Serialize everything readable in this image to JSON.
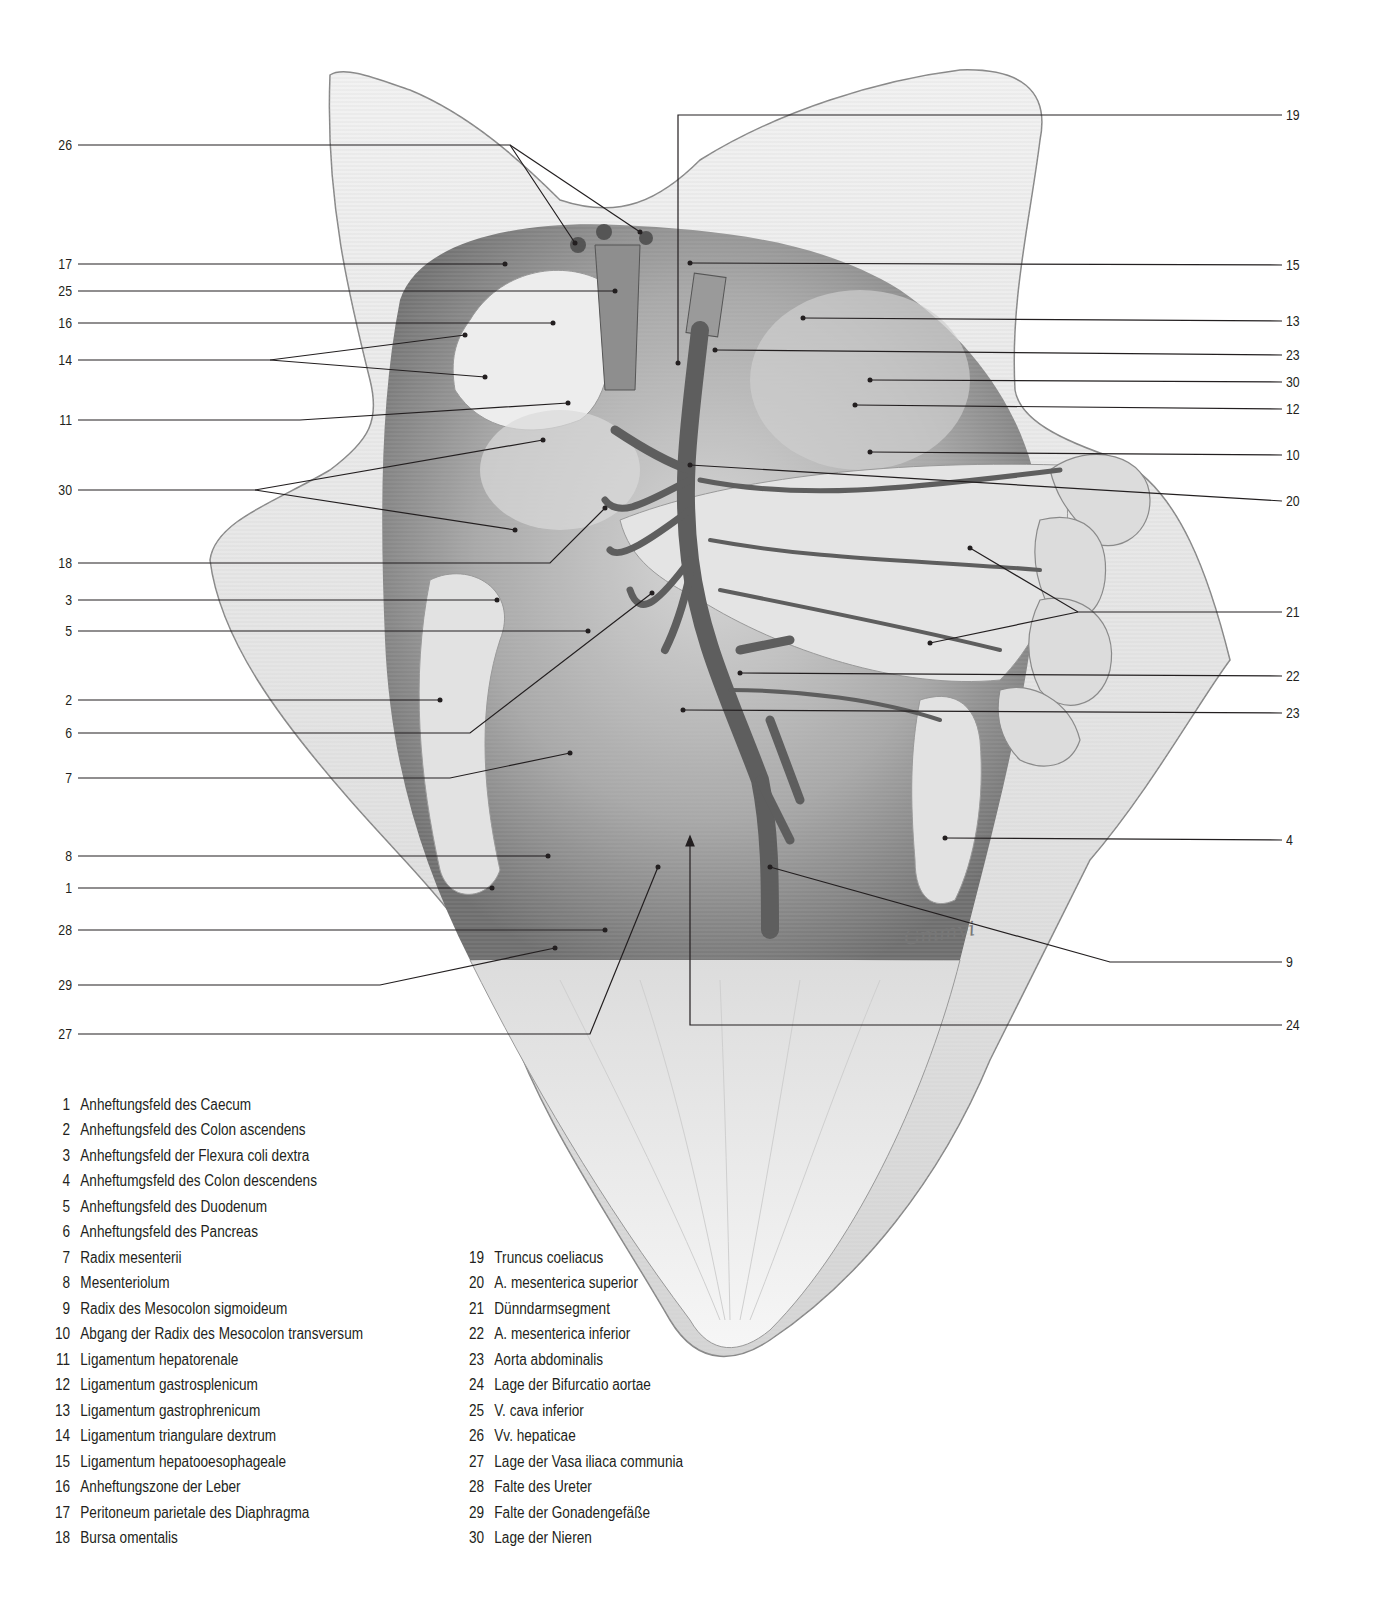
{
  "figure": {
    "colors": {
      "ink": "#231f20",
      "tissue_light": "#e9e9e9",
      "tissue_mid": "#b5b5b5",
      "tissue_dark": "#6b6b6b",
      "vessel": "#5a5a5a",
      "background": "#ffffff"
    },
    "signature": "Gmmvi",
    "left_labels": [
      {
        "num": "26",
        "y": 145
      },
      {
        "num": "17",
        "y": 264
      },
      {
        "num": "25",
        "y": 291
      },
      {
        "num": "16",
        "y": 323
      },
      {
        "num": "14",
        "y": 360
      },
      {
        "num": "11",
        "y": 420
      },
      {
        "num": "30",
        "y": 490
      },
      {
        "num": "18",
        "y": 563
      },
      {
        "num": "3",
        "y": 600
      },
      {
        "num": "5",
        "y": 631
      },
      {
        "num": "2",
        "y": 700
      },
      {
        "num": "6",
        "y": 733
      },
      {
        "num": "7",
        "y": 778
      },
      {
        "num": "8",
        "y": 856
      },
      {
        "num": "1",
        "y": 888
      },
      {
        "num": "28",
        "y": 930
      },
      {
        "num": "29",
        "y": 985
      },
      {
        "num": "27",
        "y": 1034
      }
    ],
    "right_labels": [
      {
        "num": "19",
        "y": 115
      },
      {
        "num": "15",
        "y": 265
      },
      {
        "num": "13",
        "y": 321
      },
      {
        "num": "23",
        "y": 355
      },
      {
        "num": "30",
        "y": 382
      },
      {
        "num": "12",
        "y": 409
      },
      {
        "num": "10",
        "y": 455
      },
      {
        "num": "20",
        "y": 501
      },
      {
        "num": "21",
        "y": 612
      },
      {
        "num": "22",
        "y": 676
      },
      {
        "num": "23",
        "y": 713
      },
      {
        "num": "4",
        "y": 840
      },
      {
        "num": "9",
        "y": 962
      },
      {
        "num": "24",
        "y": 1025
      }
    ]
  },
  "legend": {
    "column_1": [
      {
        "num": "1",
        "text": "Anheftungsfeld des Caecum"
      },
      {
        "num": "2",
        "text": "Anheftungsfeld des Colon ascendens"
      },
      {
        "num": "3",
        "text": "Anheftungsfeld der Flexura coli dextra"
      },
      {
        "num": "4",
        "text": "Anheftumgsfeld des Colon descendens"
      },
      {
        "num": "5",
        "text": "Anheftungsfeld des Duodenum"
      },
      {
        "num": "6",
        "text": "Anheftungsfeld des Pancreas"
      },
      {
        "num": "7",
        "text": "Radix mesenterii"
      },
      {
        "num": "8",
        "text": "Mesenteriolum"
      },
      {
        "num": "9",
        "text": "Radix des Mesocolon sigmoideum"
      },
      {
        "num": "10",
        "text": "Abgang der Radix des Mesocolon transversum"
      },
      {
        "num": "11",
        "text": "Ligamentum hepatorenale"
      },
      {
        "num": "12",
        "text": "Ligamentum gastrosplenicum"
      },
      {
        "num": "13",
        "text": "Ligamentum gastrophrenicum"
      },
      {
        "num": "14",
        "text": "Ligamentum triangulare dextrum"
      },
      {
        "num": "15",
        "text": "Ligamentum hepatooesophageale"
      },
      {
        "num": "16",
        "text": "Anheftungszone der Leber"
      },
      {
        "num": "17",
        "text": "Peritoneum parietale des Diaphragma"
      },
      {
        "num": "18",
        "text": "Bursa omentalis"
      }
    ],
    "column_2": [
      {
        "num": "19",
        "text": "Truncus coeliacus"
      },
      {
        "num": "20",
        "text": "A. mesenterica superior"
      },
      {
        "num": "21",
        "text": "Dünndarmsegment"
      },
      {
        "num": "22",
        "text": "A. mesenterica inferior"
      },
      {
        "num": "23",
        "text": "Aorta abdominalis"
      },
      {
        "num": "24",
        "text": "Lage der Bifurcatio aortae"
      },
      {
        "num": "25",
        "text": "V. cava inferior"
      },
      {
        "num": "26",
        "text": "Vv. hepaticae"
      },
      {
        "num": "27",
        "text": "Lage der Vasa iliaca communia"
      },
      {
        "num": "28",
        "text": "Falte des Ureter"
      },
      {
        "num": "29",
        "text": "Falte der Gonadengefäße"
      },
      {
        "num": "30",
        "text": "Lage der Nieren"
      }
    ]
  }
}
